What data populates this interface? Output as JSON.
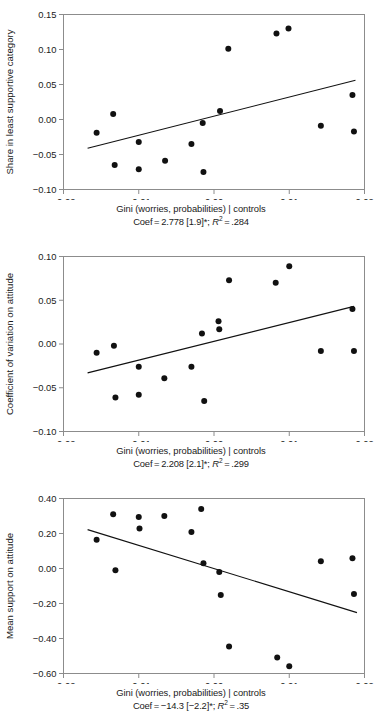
{
  "figure": {
    "panel_count": 3,
    "marker_color": "#111111",
    "frame_color": "#8c8c8c"
  },
  "chart_data": [
    {
      "type": "scatter",
      "id": "panel-1",
      "title": "",
      "xlabel": "Gini (worries, probabilities) | controls",
      "ylabel": "Share in least supportive category",
      "subcaption": "Coef = 2.778 [1.9]*; R2 = .284",
      "coef": 2.778,
      "tstat": 1.9,
      "significance": "*",
      "r_squared": 0.284,
      "xlim": [
        -0.02,
        0.02
      ],
      "ylim": [
        -0.1,
        0.15
      ],
      "xticks": [
        -0.02,
        -0.01,
        0.0,
        0.01,
        0.02
      ],
      "xticklabels": [
        "-0.02",
        "-0.01",
        "0.00",
        "0.01",
        "0.02"
      ],
      "yticks": [
        0.15,
        0.1,
        0.05,
        0.0,
        -0.05,
        -0.1
      ],
      "yticklabels": [
        "0.15",
        "0.10",
        "0.05",
        "0.00",
        "-0.05",
        "-0.10"
      ],
      "grid": false,
      "legend": "none",
      "points": [
        {
          "x": -0.0156,
          "y": -0.019
        },
        {
          "x": -0.0134,
          "y": 0.008
        },
        {
          "x": -0.0132,
          "y": -0.065
        },
        {
          "x": -0.01,
          "y": -0.032
        },
        {
          "x": -0.01,
          "y": -0.071
        },
        {
          "x": -0.0065,
          "y": -0.059
        },
        {
          "x": -0.003,
          "y": -0.035
        },
        {
          "x": -0.0015,
          "y": -0.005
        },
        {
          "x": -0.0014,
          "y": -0.075
        },
        {
          "x": 0.0008,
          "y": 0.012
        },
        {
          "x": 0.0019,
          "y": 0.101
        },
        {
          "x": 0.0083,
          "y": 0.123
        },
        {
          "x": 0.0099,
          "y": 0.13
        },
        {
          "x": 0.0142,
          "y": -0.009
        },
        {
          "x": 0.0184,
          "y": 0.035
        },
        {
          "x": 0.0186,
          "y": -0.017
        }
      ],
      "fit_line": {
        "x0": -0.0168,
        "y0": -0.041,
        "x1": 0.0188,
        "y1": 0.056
      }
    },
    {
      "type": "scatter",
      "id": "panel-2",
      "title": "",
      "xlabel": "Gini (worries, probabilities) | controls",
      "ylabel": "Coefficient of variation on attitude",
      "subcaption": "Coef = 2.208 [2.1]*; R2 = .299",
      "coef": 2.208,
      "tstat": 2.1,
      "significance": "*",
      "r_squared": 0.299,
      "xlim": [
        -0.02,
        0.02
      ],
      "ylim": [
        -0.1,
        0.1
      ],
      "xticks": [
        -0.02,
        -0.01,
        0.0,
        0.01,
        0.02
      ],
      "xticklabels": [
        "-0.02",
        "-0.01",
        "0.00",
        "0.01",
        "0.02"
      ],
      "yticks": [
        0.1,
        0.05,
        0.0,
        -0.05,
        -0.1
      ],
      "yticklabels": [
        "0.10",
        "0.05",
        "0.00",
        "-0.05",
        "-0.10"
      ],
      "grid": false,
      "legend": "none",
      "points": [
        {
          "x": -0.0156,
          "y": -0.01
        },
        {
          "x": -0.0133,
          "y": -0.002
        },
        {
          "x": -0.0131,
          "y": -0.061
        },
        {
          "x": -0.01,
          "y": -0.026
        },
        {
          "x": -0.01,
          "y": -0.058
        },
        {
          "x": -0.0066,
          "y": -0.039
        },
        {
          "x": -0.003,
          "y": -0.026
        },
        {
          "x": -0.0016,
          "y": 0.012
        },
        {
          "x": -0.0013,
          "y": -0.065
        },
        {
          "x": 0.0006,
          "y": 0.026
        },
        {
          "x": 0.0007,
          "y": 0.017
        },
        {
          "x": 0.002,
          "y": 0.073
        },
        {
          "x": 0.0082,
          "y": 0.07
        },
        {
          "x": 0.01,
          "y": 0.089
        },
        {
          "x": 0.0142,
          "y": -0.008
        },
        {
          "x": 0.0184,
          "y": 0.04
        },
        {
          "x": 0.0186,
          "y": -0.008
        }
      ],
      "fit_line": {
        "x0": -0.0168,
        "y0": -0.033,
        "x1": 0.0186,
        "y1": 0.043
      }
    },
    {
      "type": "scatter",
      "id": "panel-3",
      "title": "",
      "xlabel": "Gini (worries, probabilities) | controls",
      "ylabel": "Mean support on attitude",
      "subcaption": "Coef = -14.3 [-2.2]*; R2 = .35",
      "coef": -14.3,
      "tstat": -2.2,
      "significance": "*",
      "r_squared": 0.35,
      "xlim": [
        -0.02,
        0.02
      ],
      "ylim": [
        -0.6,
        0.4
      ],
      "xticks": [
        -0.02,
        -0.01,
        0.0,
        0.01,
        0.02
      ],
      "xticklabels": [
        "-0.02",
        "-0.01",
        "0.00",
        "0.01",
        "0.02"
      ],
      "yticks": [
        0.4,
        0.2,
        0.0,
        -0.2,
        -0.4,
        -0.6
      ],
      "yticklabels": [
        "0.40",
        "0.20",
        "0.00",
        "-0.20",
        "-0.40",
        "-0.60"
      ],
      "grid": false,
      "legend": "none",
      "points": [
        {
          "x": -0.0156,
          "y": 0.165
        },
        {
          "x": -0.0134,
          "y": 0.31
        },
        {
          "x": -0.0131,
          "y": -0.01
        },
        {
          "x": -0.01,
          "y": 0.295
        },
        {
          "x": -0.0099,
          "y": 0.228
        },
        {
          "x": -0.0066,
          "y": 0.3
        },
        {
          "x": -0.003,
          "y": 0.208
        },
        {
          "x": -0.0017,
          "y": 0.34
        },
        {
          "x": -0.0014,
          "y": 0.03
        },
        {
          "x": 0.0007,
          "y": -0.02
        },
        {
          "x": 0.0009,
          "y": -0.152
        },
        {
          "x": 0.002,
          "y": -0.445
        },
        {
          "x": 0.0084,
          "y": -0.508
        },
        {
          "x": 0.01,
          "y": -0.558
        },
        {
          "x": 0.0142,
          "y": 0.042
        },
        {
          "x": 0.0184,
          "y": 0.058
        },
        {
          "x": 0.0186,
          "y": -0.145
        }
      ],
      "fit_line": {
        "x0": -0.0168,
        "y0": 0.222,
        "x1": 0.019,
        "y1": -0.252
      }
    }
  ]
}
